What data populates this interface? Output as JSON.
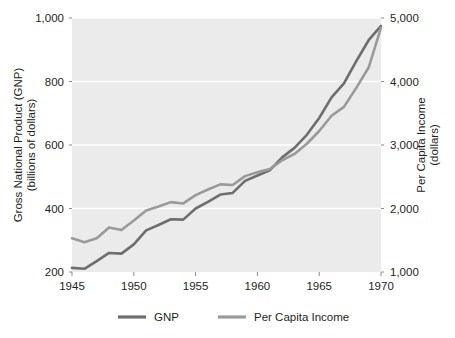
{
  "chart_data": {
    "type": "line",
    "title": "",
    "xlabel": "",
    "ylabel": "Gross National Product (GNP)",
    "ylabel2": "(billions of dollars)",
    "y2label": "Per Capita Income",
    "y2label2": "(dollars)",
    "xlim": [
      1945,
      1970
    ],
    "ylim": [
      200,
      1000
    ],
    "y2lim": [
      1000,
      5000
    ],
    "grid": true,
    "legend_position": "bottom",
    "x_ticks": [
      "1945",
      "1950",
      "1955",
      "1960",
      "1965",
      "1970"
    ],
    "x_tick_values": [
      1945,
      1950,
      1955,
      1960,
      1965,
      1970
    ],
    "y_ticks": [
      "200",
      "400",
      "600",
      "800",
      "1,000"
    ],
    "y_tick_values": [
      200,
      400,
      600,
      800,
      1000
    ],
    "y2_ticks": [
      "1,000",
      "2,000",
      "3,000",
      "4,000",
      "5,000"
    ],
    "y2_tick_values": [
      1000,
      2000,
      3000,
      4000,
      5000
    ],
    "x": [
      1945,
      1946,
      1947,
      1948,
      1949,
      1950,
      1951,
      1952,
      1953,
      1954,
      1955,
      1956,
      1957,
      1958,
      1959,
      1960,
      1961,
      1962,
      1963,
      1964,
      1965,
      1966,
      1967,
      1968,
      1969,
      1970
    ],
    "series": [
      {
        "name": "GNP",
        "color": "#6e6e6e",
        "axis": "left",
        "units": "billions of dollars",
        "values": [
          213,
          210,
          234,
          260,
          258,
          287,
          331,
          348,
          366,
          365,
          400,
          421,
          444,
          449,
          487,
          504,
          520,
          561,
          591,
          632,
          685,
          750,
          794,
          864,
          930,
          975
        ]
      },
      {
        "name": "Per Capita Income",
        "color": "#9a9a9a",
        "axis": "right",
        "units": "dollars",
        "values": [
          1530,
          1470,
          1530,
          1700,
          1660,
          1810,
          1970,
          2030,
          2100,
          2080,
          2210,
          2300,
          2380,
          2370,
          2510,
          2570,
          2620,
          2760,
          2860,
          3020,
          3220,
          3460,
          3600,
          3900,
          4220,
          4850
        ]
      }
    ],
    "legend": [
      {
        "label": "GNP",
        "color": "#6e6e6e"
      },
      {
        "label": "Per Capita Income",
        "color": "#9a9a9a"
      }
    ],
    "plot_background": "#ebebeb",
    "gridline_color": "#ffffff"
  }
}
